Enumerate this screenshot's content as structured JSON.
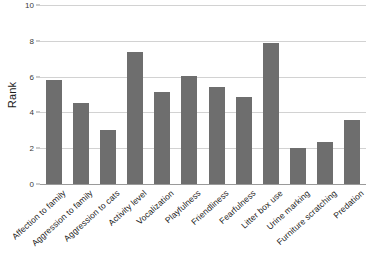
{
  "chart_data": {
    "type": "bar",
    "title": "",
    "xlabel": "",
    "ylabel": "Rank",
    "ylim": [
      0,
      10
    ],
    "yticks": [
      0,
      2,
      4,
      6,
      8,
      10
    ],
    "grid": true,
    "legend": false,
    "bar_color": "#6e6e6e",
    "gridline_color": "#d2d2d2",
    "categories": [
      "Affection to family",
      "Aggression to family",
      "Aggression to cats",
      "Activity level",
      "Vocalization",
      "Playfulness",
      "Friendliness",
      "Fearfulness",
      "Litter box use",
      "Urine marking",
      "Furniture scratching",
      "Predation"
    ],
    "values": [
      5.8,
      4.5,
      3.0,
      7.4,
      5.15,
      6.05,
      5.4,
      4.85,
      7.9,
      2.0,
      2.35,
      3.6
    ]
  },
  "axes": {
    "y_title": "Rank",
    "y_tick_labels": [
      "0",
      "2",
      "4",
      "6",
      "8",
      "10"
    ]
  }
}
